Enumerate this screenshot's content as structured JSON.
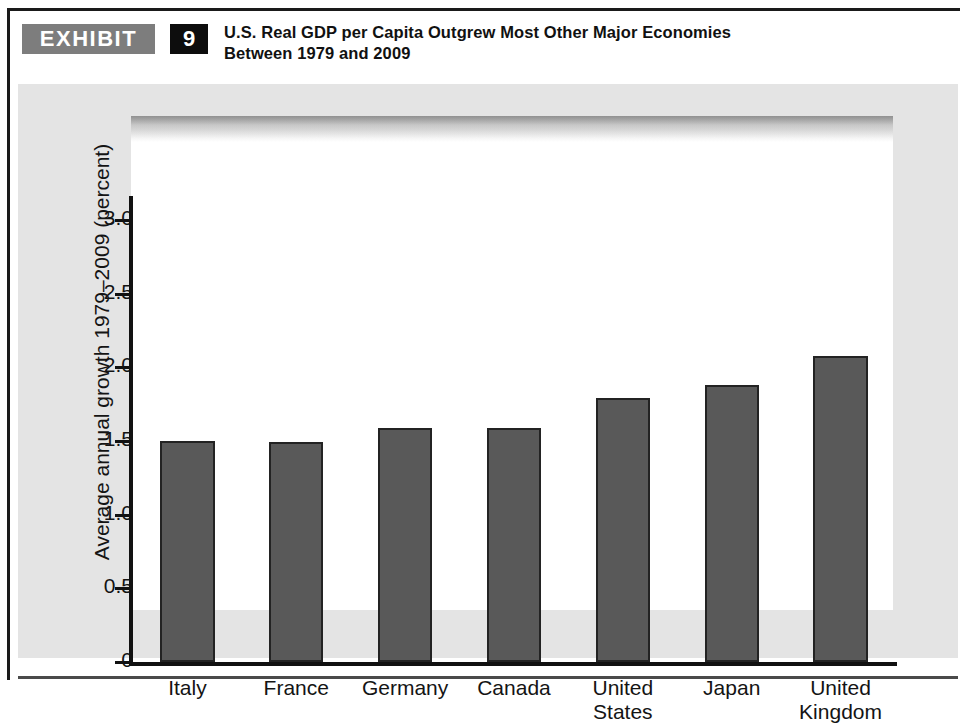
{
  "exhibit": {
    "badge_label": "EXHIBIT",
    "number": "9",
    "title_line1": "U.S. Real GDP per Capita Outgrew Most Other Major Economies",
    "title_line2": "Between 1979 and 2009"
  },
  "colors": {
    "badge_gray": "#7d7d7d",
    "number_black": "#0d0d0d",
    "bar_fill": "#595959",
    "bar_outline": "#232323",
    "panel_background": "#e4e4e4",
    "plot_background": "#ffffff",
    "axis": "#111111"
  },
  "chart_data": {
    "type": "bar",
    "title": "U.S. Real GDP per Capita Outgrew Most Other Major Economies Between 1979 and 2009",
    "categories": [
      "Italy",
      "France",
      "Germany",
      "Canada",
      "United States",
      "Japan",
      "United Kingdom"
    ],
    "category_lines": [
      [
        "Italy"
      ],
      [
        "France"
      ],
      [
        "Germany"
      ],
      [
        "Canada"
      ],
      [
        "United",
        "States"
      ],
      [
        "Japan"
      ],
      [
        "United",
        "Kingdom"
      ]
    ],
    "values": [
      1.5,
      1.49,
      1.59,
      1.59,
      1.79,
      1.88,
      2.08
    ],
    "xlabel": "",
    "ylabel": "Average annual growth 1979–2009 (percent)",
    "ylim": [
      0,
      3.0
    ],
    "yticks": [
      0,
      0.5,
      1.0,
      1.5,
      2.0,
      2.5,
      3.0
    ],
    "ytick_labels": [
      "0",
      "0.5",
      "1.0",
      "1.5",
      "2.0",
      "2.5",
      "3.0"
    ],
    "grid": false,
    "legend": false
  }
}
